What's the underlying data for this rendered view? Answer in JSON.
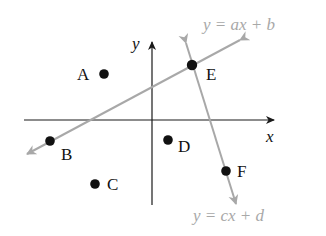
{
  "diagram": {
    "type": "coordinate-plane",
    "axes": {
      "x_label": "x",
      "y_label": "y",
      "axis_color": "#1a1a1a"
    },
    "points": [
      {
        "label": "A",
        "cx": 104,
        "cy": 74
      },
      {
        "label": "B",
        "cx": 50,
        "cy": 141
      },
      {
        "label": "C",
        "cx": 95,
        "cy": 184
      },
      {
        "label": "D",
        "cx": 168,
        "cy": 140
      },
      {
        "label": "E",
        "cx": 192,
        "cy": 65
      },
      {
        "label": "F",
        "cx": 226,
        "cy": 171
      }
    ],
    "lines": [
      {
        "equation": "y = ax + b",
        "passes_through": [
          "B",
          "E"
        ],
        "color": "#a8a8a8"
      },
      {
        "equation": "y = cx + d",
        "passes_through": [
          "E",
          "F"
        ],
        "color": "#a8a8a8"
      }
    ]
  }
}
